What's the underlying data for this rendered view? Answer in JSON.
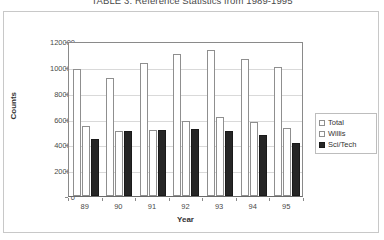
{
  "figure": {
    "title": "TABLE 3. Reference Statistics from 1989-1995"
  },
  "legend": {
    "position": "right",
    "entries": [
      {
        "label": "Total",
        "swatch": "total",
        "color": "#ffffff"
      },
      {
        "label": "Willis",
        "swatch": "willis",
        "color": "#ffffff"
      },
      {
        "label": "Sci/Tech",
        "swatch": "scitech",
        "color": "#262626"
      }
    ]
  },
  "axes": {
    "y_ticks": [
      "0",
      "20000",
      "40000",
      "60000",
      "80000",
      "100000",
      "120000"
    ],
    "x_ticks": [
      "89",
      "90",
      "91",
      "92",
      "93",
      "94",
      "95"
    ]
  },
  "chart_data": {
    "type": "bar",
    "title": "TABLE 3. Reference Statistics from 1989-1995",
    "xlabel": "Year",
    "ylabel": "Counts",
    "categories": [
      "89",
      "90",
      "91",
      "92",
      "93",
      "94",
      "95"
    ],
    "series": [
      {
        "name": "Total",
        "color": "#ffffff",
        "values": [
          98000,
          91000,
          103000,
          110000,
          113000,
          106000,
          100000
        ]
      },
      {
        "name": "Willis",
        "color": "#ffffff",
        "values": [
          54000,
          50000,
          51000,
          58000,
          61000,
          57000,
          53000
        ]
      },
      {
        "name": "Sci/Tech",
        "color": "#262626",
        "values": [
          44000,
          50000,
          51000,
          52000,
          50000,
          47000,
          41000
        ]
      }
    ],
    "ylim": [
      0,
      120000
    ],
    "ytick_step": 20000,
    "grid": true,
    "legend_position": "right"
  }
}
